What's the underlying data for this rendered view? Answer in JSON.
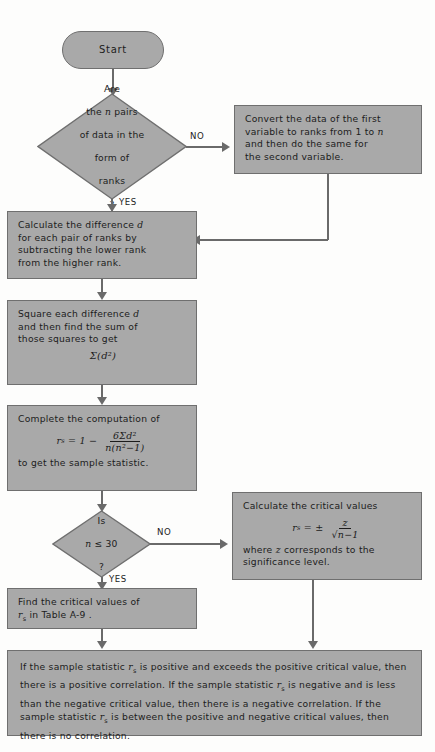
{
  "meta": {
    "fill_color": "#a9a9a9",
    "border_color": "#6f6f6f",
    "line_color": "#6a6a6a",
    "background_color": "#fdfdfc",
    "text_color": "#1c1c1c"
  },
  "nodes": {
    "start": {
      "label": "Start",
      "shape": "terminator"
    },
    "decision_ranks": {
      "line1": "Are",
      "line2": "the n pairs",
      "line3": "of data in the",
      "line4": "form of",
      "line5": "ranks",
      "line6": "?",
      "shape": "decision"
    },
    "convert_ranks": {
      "text": "Convert the data of the first variable to ranks from 1 to n and then do the same for the second variable.",
      "shape": "process"
    },
    "calculate_difference": {
      "text": "Calculate the difference d for each pair of ranks by subtracting the lower rank from the higher rank.",
      "shape": "process"
    },
    "square_difference": {
      "text": "Square each difference d and then find the sum of those squares to get",
      "formula": "Σ(d²)",
      "shape": "process"
    },
    "complete_computation": {
      "intro": "Complete the computation of",
      "formula_lhs": "r",
      "formula_sub": "s",
      "formula_eq": "= 1 −",
      "formula_numerator": "6Σd²",
      "formula_denominator": "n(n²−1)",
      "outro": "to get the sample statistic.",
      "shape": "process"
    },
    "decision_n30": {
      "line1": "Is",
      "line2": "n ≤ 30",
      "line3": "?",
      "shape": "decision"
    },
    "calc_critical_values": {
      "intro": "Calculate the critical values",
      "formula_lhs": "r",
      "formula_sub": "s",
      "formula_eq": "= ±",
      "formula_numerator": "z",
      "formula_denominator": "√n−1",
      "outro": "where z corresponds to the significance level.",
      "shape": "process"
    },
    "find_critical_values": {
      "line1": "Find the critical values of",
      "line2_pre": "r",
      "line2_sub": "s",
      "line2_post": " in Table A-9 .",
      "shape": "process"
    },
    "conclusion": {
      "segments": [
        "If the sample statistic ",
        "r",
        "s",
        " is positive and exceeds the positive critical value, then there is a positive correlation. If the sample statistic ",
        "r",
        "s",
        " is negative and is less than the negative critical value, then there is a negative correlation. If the sample statistic ",
        "r",
        "s",
        " is between the positive and negative critical values, then there is no correlation."
      ],
      "shape": "process"
    }
  },
  "edges": {
    "ranks_no": "NO",
    "ranks_yes": "YES",
    "n30_no": "NO",
    "n30_yes": "YES"
  }
}
